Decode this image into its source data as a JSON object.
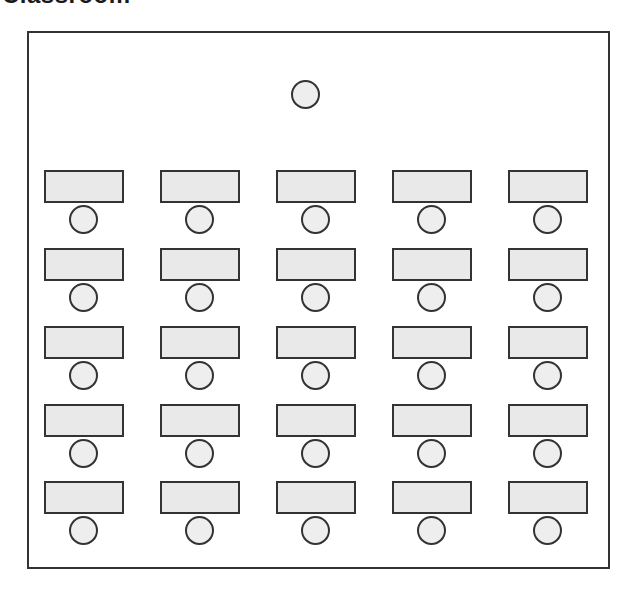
{
  "title": "Classroom",
  "colors": {
    "outline": "#333333",
    "desk_fill": "#e9e9e9",
    "seat_fill": "#eeeeee",
    "background": "#ffffff"
  },
  "teacher": {
    "seat_icon": "circle-seat",
    "label": ""
  },
  "layout": {
    "columns": 5,
    "rows": 5,
    "column_x": [
      44,
      160,
      276,
      392,
      508
    ],
    "row_y": [
      170,
      248,
      326,
      404,
      481
    ]
  },
  "desks": [
    {
      "row": 1,
      "col": 1,
      "label": ""
    },
    {
      "row": 1,
      "col": 2,
      "label": ""
    },
    {
      "row": 1,
      "col": 3,
      "label": ""
    },
    {
      "row": 1,
      "col": 4,
      "label": ""
    },
    {
      "row": 1,
      "col": 5,
      "label": ""
    },
    {
      "row": 2,
      "col": 1,
      "label": ""
    },
    {
      "row": 2,
      "col": 2,
      "label": ""
    },
    {
      "row": 2,
      "col": 3,
      "label": ""
    },
    {
      "row": 2,
      "col": 4,
      "label": ""
    },
    {
      "row": 2,
      "col": 5,
      "label": ""
    },
    {
      "row": 3,
      "col": 1,
      "label": ""
    },
    {
      "row": 3,
      "col": 2,
      "label": ""
    },
    {
      "row": 3,
      "col": 3,
      "label": ""
    },
    {
      "row": 3,
      "col": 4,
      "label": ""
    },
    {
      "row": 3,
      "col": 5,
      "label": ""
    },
    {
      "row": 4,
      "col": 1,
      "label": ""
    },
    {
      "row": 4,
      "col": 2,
      "label": ""
    },
    {
      "row": 4,
      "col": 3,
      "label": ""
    },
    {
      "row": 4,
      "col": 4,
      "label": ""
    },
    {
      "row": 4,
      "col": 5,
      "label": ""
    },
    {
      "row": 5,
      "col": 1,
      "label": ""
    },
    {
      "row": 5,
      "col": 2,
      "label": ""
    },
    {
      "row": 5,
      "col": 3,
      "label": ""
    },
    {
      "row": 5,
      "col": 4,
      "label": ""
    },
    {
      "row": 5,
      "col": 5,
      "label": ""
    }
  ]
}
